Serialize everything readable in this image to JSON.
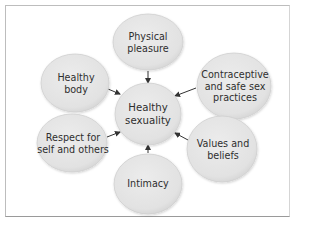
{
  "diagram": {
    "type": "hub-and-spoke",
    "center": {
      "id": "healthy-sexuality",
      "label": "Healthy\nsexuality"
    },
    "nodes": [
      {
        "id": "physical-pleasure",
        "label": "Physical\npleasure"
      },
      {
        "id": "healthy-body",
        "label": "Healthy\nbody"
      },
      {
        "id": "contraceptive-safe-sex",
        "label": "Contraceptive\nand safe sex\npractices"
      },
      {
        "id": "respect",
        "label": "Respect for\nself and others"
      },
      {
        "id": "values-beliefs",
        "label": "Values and\nbeliefs"
      },
      {
        "id": "intimacy",
        "label": "Intimacy"
      }
    ],
    "edges": [
      {
        "from": "physical-pleasure",
        "to": "healthy-sexuality"
      },
      {
        "from": "healthy-body",
        "to": "healthy-sexuality"
      },
      {
        "from": "contraceptive-safe-sex",
        "to": "healthy-sexuality"
      },
      {
        "from": "respect",
        "to": "healthy-sexuality"
      },
      {
        "from": "values-beliefs",
        "to": "healthy-sexuality"
      },
      {
        "from": "intimacy",
        "to": "healthy-sexuality"
      }
    ],
    "colors": {
      "node_fill": "#e4e4e4",
      "node_edge": "#c9c9c9",
      "arrow": "#333333",
      "text": "#2e2e2e",
      "border": "#bdbdbd"
    }
  }
}
